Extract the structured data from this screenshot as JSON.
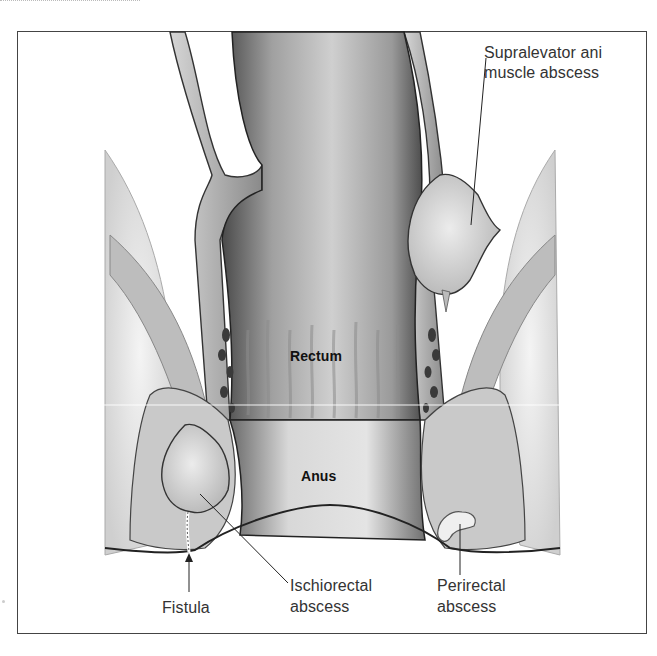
{
  "figure": {
    "type": "anatomical illustration",
    "labels": {
      "supralevator": "Supralevator ani\nmuscle abscess",
      "supralevator_line1": "Supralevator ani",
      "supralevator_line2": "muscle abscess",
      "rectum": "Rectum",
      "anus": "Anus",
      "fistula": "Fistula",
      "ischiorectal_line1": "Ischiorectal",
      "ischiorectal_line2": "abscess",
      "perirectal_line1": "Perirectal",
      "perirectal_line2": "abscess"
    },
    "colors": {
      "frame_border": "#444444",
      "label_text": "#333333",
      "tissue_dark": "#5a5a5a",
      "tissue_mid": "#9a9a9a",
      "tissue_light": "#dcdcdc",
      "abscess_fill": "#e6e6e6",
      "background": "#ffffff"
    }
  }
}
